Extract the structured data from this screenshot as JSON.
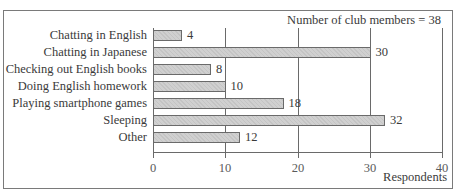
{
  "chart_data": {
    "type": "bar",
    "orientation": "horizontal",
    "categories": [
      "Chatting in English",
      "Chatting in Japanese",
      "Checking out English books",
      "Doing English homework",
      "Playing smartphone games",
      "Sleeping",
      "Other"
    ],
    "values": [
      4,
      30,
      8,
      10,
      18,
      32,
      12
    ],
    "value_labels": [
      "4",
      "30",
      "8",
      "10",
      "18",
      "32",
      "12"
    ],
    "title": "",
    "annotation": "Number of club members = 38",
    "xlabel": "Respondents",
    "ylabel": "",
    "xlim": [
      0,
      40
    ],
    "xticks": [
      "0",
      "10",
      "20",
      "30",
      "40"
    ],
    "grid": true,
    "legend": null,
    "bar_color": "#c8c8c8",
    "bar_edge_color": "#6a6a6a"
  }
}
